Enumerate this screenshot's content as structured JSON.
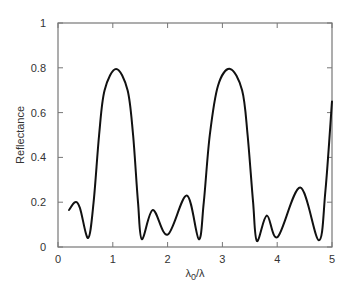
{
  "chart_data": {
    "type": "line",
    "title": "",
    "xlabel": "λ0/λ",
    "ylabel": "Reflectance",
    "xlim": [
      0,
      5
    ],
    "ylim": [
      0,
      1
    ],
    "grid": false,
    "legend": null,
    "x_ticks": [
      "0",
      "1",
      "2",
      "3",
      "4",
      "5"
    ],
    "y_ticks": [
      "0",
      "0.2",
      "0.4",
      "0.6",
      "0.8",
      "1"
    ],
    "series": [
      {
        "name": "Reflectance",
        "color": "#111111",
        "x": [
          0.2,
          0.31,
          0.4,
          0.55,
          0.65,
          0.75,
          0.85,
          1.06,
          1.27,
          1.37,
          1.46,
          1.53,
          1.73,
          2.0,
          2.35,
          2.57,
          2.66,
          2.77,
          2.92,
          3.14,
          3.36,
          3.46,
          3.56,
          3.63,
          3.81,
          4.01,
          4.42,
          4.76,
          4.88,
          5.0
        ],
        "values": [
          0.165,
          0.2,
          0.175,
          0.04,
          0.2,
          0.5,
          0.7,
          0.795,
          0.7,
          0.5,
          0.2,
          0.035,
          0.165,
          0.055,
          0.23,
          0.035,
          0.2,
          0.5,
          0.72,
          0.795,
          0.7,
          0.5,
          0.2,
          0.027,
          0.14,
          0.045,
          0.265,
          0.03,
          0.25,
          0.65
        ]
      }
    ]
  }
}
